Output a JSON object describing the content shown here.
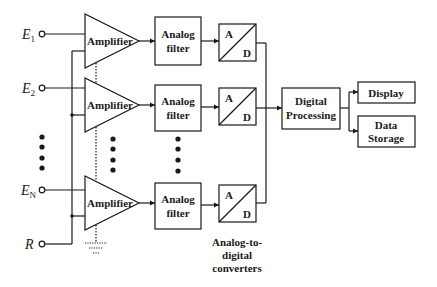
{
  "diagram": {
    "type": "block-diagram",
    "colors": {
      "line": "#1a1a1a",
      "background": "#ffffff"
    },
    "inputs": [
      {
        "label": "E",
        "subscript": "1"
      },
      {
        "label": "E",
        "subscript": "2"
      },
      {
        "label": "E",
        "subscript": "N"
      },
      {
        "label": "R",
        "subscript": ""
      }
    ],
    "channels": [
      {
        "amplifier": "Amplifier",
        "filter_line1": "Analog",
        "filter_line2": "filter",
        "adc_top": "A",
        "adc_bottom": "D"
      },
      {
        "amplifier": "Amplifier",
        "filter_line1": "Analog",
        "filter_line2": "filter",
        "adc_top": "A",
        "adc_bottom": "D"
      },
      {
        "amplifier": "Amplifier",
        "filter_line1": "Analog",
        "filter_line2": "filter",
        "adc_top": "A",
        "adc_bottom": "D"
      }
    ],
    "adc_caption": [
      "Analog-to-",
      "digital",
      "converters"
    ],
    "processing": {
      "line1": "Digital",
      "line2": "Processing"
    },
    "outputs": [
      {
        "line1": "Display",
        "line2": ""
      },
      {
        "line1": "Data",
        "line2": "Storage"
      }
    ]
  }
}
